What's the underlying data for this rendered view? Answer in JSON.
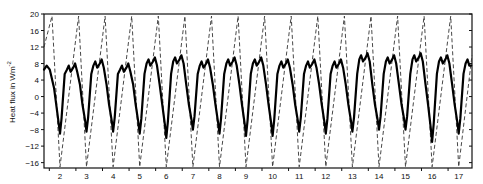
{
  "chart_data": {
    "type": "line",
    "title": "",
    "xlabel": "",
    "ylabel": "Heat flux in Wm",
    "ylabel_superscript": "-2",
    "xlim": [
      1.4,
      17.5
    ],
    "ylim": [
      -17.3,
      20
    ],
    "y_ticks": [
      20,
      16,
      12,
      8,
      4,
      0,
      -4,
      -8,
      -12,
      -16
    ],
    "x_tick_labels": [
      2,
      3,
      4,
      5,
      6,
      7,
      8,
      9,
      10,
      11,
      12,
      13,
      14,
      15,
      16,
      17
    ],
    "grid": false,
    "legend": "none",
    "series": [
      {
        "name": "modelled",
        "style": "dashed",
        "color": "#333333",
        "points": [
          [
            1.4,
            12
          ],
          [
            1.7,
            19.5
          ],
          [
            2.0,
            -17
          ],
          [
            2.7,
            19.5
          ],
          [
            3.0,
            -17
          ],
          [
            3.7,
            19.5
          ],
          [
            4.0,
            -17
          ],
          [
            4.7,
            19.5
          ],
          [
            5.0,
            -17
          ],
          [
            5.7,
            19.5
          ],
          [
            6.0,
            -17
          ],
          [
            6.7,
            19.5
          ],
          [
            7.0,
            -17
          ],
          [
            7.7,
            19.5
          ],
          [
            8.0,
            -17
          ],
          [
            8.7,
            19.5
          ],
          [
            9.0,
            -17
          ],
          [
            9.7,
            19.5
          ],
          [
            10.0,
            -17
          ],
          [
            10.7,
            19.5
          ],
          [
            11.0,
            -17
          ],
          [
            11.7,
            19.5
          ],
          [
            12.0,
            -17
          ],
          [
            12.7,
            19.5
          ],
          [
            13.0,
            -17
          ],
          [
            13.7,
            19.5
          ],
          [
            14.0,
            -17
          ],
          [
            14.7,
            19.5
          ],
          [
            15.0,
            -17
          ],
          [
            15.7,
            19.5
          ],
          [
            16.0,
            -17
          ],
          [
            16.7,
            19.5
          ],
          [
            17.0,
            -17
          ],
          [
            17.5,
            10
          ]
        ]
      },
      {
        "name": "observed",
        "style": "solid",
        "color": "#000000",
        "daily_troughs": [
          -9,
          -8.5,
          -8.5,
          -9,
          -10,
          -8,
          -9,
          -9.5,
          -9.5,
          -8.5,
          -9,
          -8.5,
          -8,
          -8,
          -11,
          -9
        ],
        "daily_peaks": [
          8,
          9,
          8,
          9.5,
          10,
          9,
          9.5,
          9.5,
          9,
          9,
          9,
          10.5,
          10,
          10.5,
          10,
          9.5
        ],
        "start_value": 6.5,
        "end_value": 7.5
      }
    ]
  }
}
